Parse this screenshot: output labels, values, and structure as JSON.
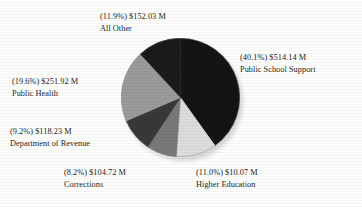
{
  "chart_data": {
    "type": "pie",
    "title": "",
    "subtitle": "",
    "xlabel": "",
    "ylabel": "",
    "legend_position": "callout-labels",
    "grid": false,
    "value_unit": "M",
    "value_prefix": "$",
    "start_angle_deg": 0,
    "direction": "clockwise",
    "categories": [
      "Public School Support",
      "Higher Education",
      "Corrections",
      "Department of Revenue",
      "Public Health",
      "All Other"
    ],
    "values": [
      514.14,
      10.07,
      104.72,
      118.23,
      251.92,
      152.03
    ],
    "percentages": [
      40.1,
      11.0,
      8.2,
      9.2,
      19.6,
      11.9
    ],
    "colors": [
      "#141414",
      "#dcdcdc",
      "#787878",
      "#383838",
      "#9a9a9a",
      "#1a1a1a"
    ],
    "slices": [
      {
        "name": "Public School Support",
        "percent": 40.1,
        "value": 514.14,
        "value_label": "$514.14 M",
        "percent_label": "(40.1%)",
        "color": "#141414"
      },
      {
        "name": "Higher Education",
        "percent": 11.0,
        "value": 10.07,
        "value_label": "$10.07 M",
        "percent_label": "(11.0%)",
        "color": "#dcdcdc"
      },
      {
        "name": "Corrections",
        "percent": 8.2,
        "value": 104.72,
        "value_label": "$104.72 M",
        "percent_label": "(8.2%)",
        "color": "#787878"
      },
      {
        "name": "Department of Revenue",
        "percent": 9.2,
        "value": 118.23,
        "value_label": "$118.23 M",
        "percent_label": "(9.2%)",
        "color": "#383838"
      },
      {
        "name": "Public Health",
        "percent": 19.6,
        "value": 251.92,
        "value_label": "$251.92 M",
        "percent_label": "(19.6%)",
        "color": "#9a9a9a"
      },
      {
        "name": "All Other",
        "percent": 11.9,
        "value": 152.03,
        "value_label": "$152.03 M",
        "percent_label": "(11.9%)",
        "color": "#1a1a1a"
      }
    ]
  },
  "labels": {
    "all_other": {
      "line1": "(11.9%) $152.03 M",
      "line2": "All Other"
    },
    "public_school": {
      "line1": "(40.1%) $514.14 M",
      "line2": "Public School Support"
    },
    "public_health": {
      "line1": "(19.6%) $251.92 M",
      "line2": "Public Health"
    },
    "dept_revenue": {
      "line1": "(9.2%) $118.23 M",
      "line2": "Department of Revenue"
    },
    "corrections": {
      "line1": "(8.2%) $104.72 M",
      "line2": "Corrections"
    },
    "higher_education": {
      "line1": "(11.0%) $10.07 M",
      "line2": "Higher Education"
    }
  }
}
